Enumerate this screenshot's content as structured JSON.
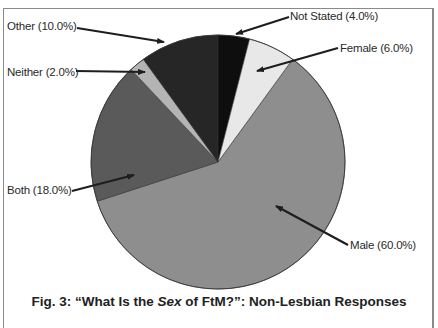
{
  "chart_data": {
    "type": "pie",
    "title": "Fig. 3: “What Is the Sex of FtM?”: Non-Lesbian Responses",
    "title_parts": {
      "prefix": "Fig. 3: “What Is the ",
      "italic": "Sex",
      "suffix": " of FtM?”: Non-Lesbian Responses"
    },
    "start_angle_deg": -54,
    "direction": "clockwise",
    "slices": [
      {
        "name": "Male",
        "value": 60.0,
        "label": "Male (60.0%)",
        "color": "#8e8e8e"
      },
      {
        "name": "Both",
        "value": 18.0,
        "label": "Both (18.0%)",
        "color": "#5a5a5a"
      },
      {
        "name": "Neither",
        "value": 2.0,
        "label": "Neither (2.0%)",
        "color": "#b4b4b4"
      },
      {
        "name": "Other",
        "value": 10.0,
        "label": "Other (10.0%)",
        "color": "#262626"
      },
      {
        "name": "Not Stated",
        "value": 4.0,
        "label": "Not Stated (4.0%)",
        "color": "#0e0e0e"
      },
      {
        "name": "Female",
        "value": 6.0,
        "label": "Female (6.0%)",
        "color": "#e8e8e8"
      }
    ],
    "legend": "callout labels with arrows",
    "grid": false
  }
}
